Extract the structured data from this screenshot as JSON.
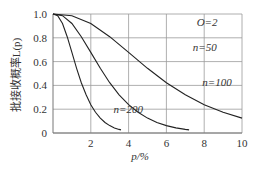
{
  "chart_data": {
    "type": "line",
    "title": "",
    "annotation": "O=2",
    "xlabel": "p/%",
    "ylabel": "批接收概率L(p)",
    "xlim": [
      0,
      10
    ],
    "ylim": [
      0,
      1.0
    ],
    "grid": true,
    "x_ticks": [
      "2",
      "4",
      "6",
      "8",
      "10"
    ],
    "y_ticks": [
      "0",
      "0.2",
      "0.4",
      "0.6",
      "0.8",
      "1.0"
    ],
    "series": [
      {
        "name": "n=50",
        "label": "n=50",
        "x": [
          0,
          1,
          2,
          3,
          4,
          5,
          6,
          7,
          8,
          9,
          10
        ],
        "y": [
          1.0,
          0.986,
          0.92,
          0.809,
          0.677,
          0.544,
          0.423,
          0.321,
          0.238,
          0.174,
          0.125
        ]
      },
      {
        "name": "n=100",
        "label": "n=100",
        "x": [
          0,
          0.5,
          1,
          1.5,
          2,
          2.5,
          3,
          3.5,
          4,
          4.5,
          5,
          5.5,
          6,
          6.5,
          7,
          7.2
        ],
        "y": [
          1.0,
          0.986,
          0.92,
          0.809,
          0.677,
          0.544,
          0.423,
          0.321,
          0.238,
          0.174,
          0.125,
          0.088,
          0.062,
          0.043,
          0.03,
          0.026
        ]
      },
      {
        "name": "n=200",
        "label": "n=200",
        "x": [
          0,
          0.25,
          0.5,
          0.75,
          1,
          1.25,
          1.5,
          1.75,
          2,
          2.25,
          2.5,
          2.75,
          3,
          3.25,
          3.5,
          3.6
        ],
        "y": [
          1.0,
          0.986,
          0.92,
          0.809,
          0.677,
          0.544,
          0.423,
          0.321,
          0.238,
          0.174,
          0.125,
          0.088,
          0.062,
          0.043,
          0.03,
          0.026
        ]
      }
    ],
    "label_positions": {
      "O=2": [
        7.6,
        0.93
      ],
      "n=50": [
        7.4,
        0.72
      ],
      "n=100": [
        7.9,
        0.43
      ],
      "n=200": [
        3.2,
        0.2
      ]
    }
  },
  "plot": {
    "left": 53,
    "right": 242,
    "top": 14,
    "bottom": 133
  }
}
